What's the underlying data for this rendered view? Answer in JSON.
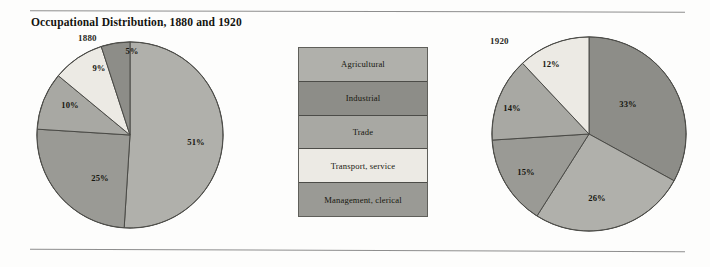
{
  "figure": {
    "title": "Occupational Distribution, 1880 and 1920",
    "background": "#fdfdfc",
    "rule_color": "#8e8e8e"
  },
  "legend": {
    "items": [
      {
        "label": "Agricultural",
        "color": "#b0b0ab"
      },
      {
        "label": "Industrial",
        "color": "#8d8d88"
      },
      {
        "label": "Trade",
        "color": "#a8a8a3"
      },
      {
        "label": "Transport, service",
        "color": "#eceae4"
      },
      {
        "label": "Management, clerical",
        "color": "#9a9a95"
      }
    ]
  },
  "chart_data": [
    {
      "type": "pie",
      "title": "1880",
      "categories": [
        "Agricultural",
        "Management, clerical",
        "Trade",
        "Transport, service",
        "Industrial"
      ],
      "values": [
        51,
        25,
        10,
        9,
        5
      ],
      "labels": [
        "51%",
        "25%",
        "10%",
        "9%",
        "5%"
      ],
      "colors": [
        "#b0b0ab",
        "#9a9a95",
        "#a8a8a3",
        "#eceae4",
        "#8d8d88"
      ],
      "start_angle_deg": 0,
      "direction": "clockwise",
      "total": 100
    },
    {
      "type": "pie",
      "title": "1920",
      "categories": [
        "Industrial",
        "Agricultural",
        "Management, clerical",
        "Trade",
        "Transport, service"
      ],
      "values": [
        33,
        26,
        15,
        14,
        12
      ],
      "labels": [
        "33%",
        "26%",
        "15%",
        "14%",
        "12%"
      ],
      "colors": [
        "#8d8d88",
        "#b0b0ab",
        "#9a9a95",
        "#a8a8a3",
        "#eceae4"
      ],
      "start_angle_deg": 0,
      "direction": "clockwise",
      "total": 100
    }
  ],
  "pies": {
    "left": {
      "year": "1880",
      "slices": [
        {
          "label": "51%",
          "lx": 196,
          "ly": 142
        },
        {
          "label": "25%",
          "lx": 100,
          "ly": 178
        },
        {
          "label": "10%",
          "lx": 70,
          "ly": 105
        },
        {
          "label": "9%",
          "lx": 99,
          "ly": 68
        },
        {
          "label": "5%",
          "lx": 132,
          "ly": 51
        }
      ]
    },
    "right": {
      "year": "1920",
      "slices": [
        {
          "label": "33%",
          "lx": 628,
          "ly": 104
        },
        {
          "label": "26%",
          "lx": 597,
          "ly": 198
        },
        {
          "label": "15%",
          "lx": 526,
          "ly": 172
        },
        {
          "label": "14%",
          "lx": 512,
          "ly": 108
        },
        {
          "label": "12%",
          "lx": 551,
          "ly": 64
        }
      ]
    }
  }
}
